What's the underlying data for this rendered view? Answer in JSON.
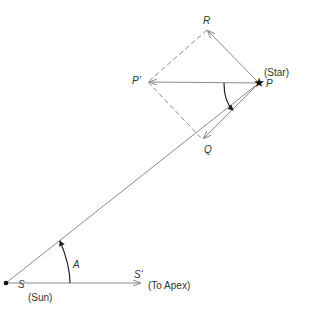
{
  "diagram": {
    "points": {
      "S": {
        "label": "S",
        "note": "(Sun)"
      },
      "S_prime": {
        "label": "S'",
        "note": "(To Apex)"
      },
      "P": {
        "label": "P",
        "note": "(Star)"
      },
      "P_prime": {
        "label": "P'"
      },
      "Q": {
        "label": "Q"
      },
      "R": {
        "label": "R"
      }
    },
    "angle_label": "A",
    "colors": {
      "line": "#8a8a8a",
      "text": "#333333",
      "marker": "#111111"
    }
  }
}
